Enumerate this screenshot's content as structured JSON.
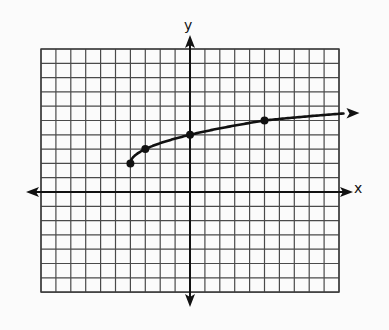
{
  "chart_data": {
    "type": "line",
    "title": "",
    "xlabel": "x",
    "ylabel": "y",
    "function_hint": "y = sqrt(x + 4) + 2",
    "grid": true,
    "grid_extent": {
      "x_min": -10,
      "x_max": 10,
      "y_min": -7,
      "y_max": 10
    },
    "xlim": [
      -10,
      10
    ],
    "ylim": [
      -7,
      10
    ],
    "tick_labels": false,
    "series": [
      {
        "name": "curve",
        "start_point": {
          "x": -4,
          "y": 2
        },
        "end_arrow": true,
        "marked_points": [
          {
            "x": -4,
            "y": 2
          },
          {
            "x": -3,
            "y": 3
          },
          {
            "x": 0,
            "y": 4
          },
          {
            "x": 5,
            "y": 5
          }
        ],
        "color": "#111111"
      }
    ],
    "axes": {
      "x_arrows": "both",
      "y_arrows": "both"
    }
  },
  "labels": {
    "x_axis": "x",
    "y_axis": "y"
  },
  "colors": {
    "background": "#fbfbfb",
    "grid": "#4a4a4a",
    "axis": "#111111",
    "curve": "#111111"
  }
}
